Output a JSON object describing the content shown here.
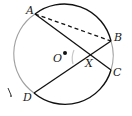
{
  "diagram": {
    "type": "circle-geometry",
    "circle": {
      "center_label": "O"
    },
    "points": [
      {
        "id": "A",
        "label": "A"
      },
      {
        "id": "B",
        "label": "B"
      },
      {
        "id": "C",
        "label": "C"
      },
      {
        "id": "D",
        "label": "D"
      },
      {
        "id": "X",
        "label": "X"
      },
      {
        "id": "O",
        "label": "O"
      }
    ],
    "segments": [
      {
        "from": "A",
        "to": "C",
        "style": "solid"
      },
      {
        "from": "D",
        "to": "B",
        "style": "solid"
      },
      {
        "from": "A",
        "to": "B",
        "style": "dashed"
      }
    ],
    "intersection": "X",
    "colors": {
      "stroke": "#111111",
      "light_arc": "#9a9a9a"
    }
  }
}
